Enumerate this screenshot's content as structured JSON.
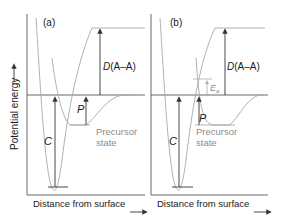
{
  "y_axis_label": "Potential energy",
  "panels": [
    {
      "id": "a",
      "label": "(a)",
      "dissociation_label_italic": "D",
      "dissociation_label_rest": "(A–A)",
      "chemisorption_label": "C",
      "precursor_label": "P",
      "precursor_state_line1": "Precursor",
      "precursor_state_line2": "state",
      "x_axis_label": "Distance from surface"
    },
    {
      "id": "b",
      "label": "(b)",
      "dissociation_label_italic": "D",
      "dissociation_label_rest": "(A–A)",
      "chemisorption_label": "C",
      "precursor_label": "P",
      "activation_label_italic": "E",
      "activation_label_sub": "a",
      "precursor_state_line1": "Precursor",
      "precursor_state_line2": "state",
      "x_axis_label": "Distance from surface"
    }
  ],
  "colors": {
    "axis": "#555555",
    "curve": "#a8a8a8",
    "arrow": "#333333",
    "grey_text": "#8c8c8c"
  }
}
